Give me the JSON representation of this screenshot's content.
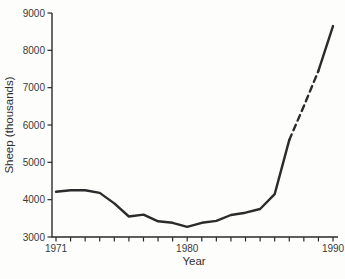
{
  "chart_data": {
    "type": "line",
    "title": "",
    "xlabel": "Year",
    "ylabel": "Sheep (thousands)",
    "x": [
      1971,
      1972,
      1973,
      1974,
      1975,
      1976,
      1977,
      1978,
      1979,
      1980,
      1981,
      1982,
      1983,
      1984,
      1985,
      1986,
      1987,
      1988,
      1989,
      1990
    ],
    "values": [
      4210,
      4250,
      4250,
      4180,
      3900,
      3550,
      3600,
      3420,
      3380,
      3270,
      3380,
      3430,
      3590,
      3650,
      3750,
      4150,
      5600,
      6500,
      7450,
      8650
    ],
    "dashed_segment": {
      "from_year": 1987,
      "to_year": 1989,
      "meaning": "dashed-projection"
    },
    "xlim": [
      1971,
      1990
    ],
    "ylim": [
      3000,
      9000
    ],
    "y_ticks": [
      3000,
      4000,
      5000,
      6000,
      7000,
      8000,
      9000
    ],
    "x_ticks_every_year": true,
    "labeled_x_ticks": [
      1971,
      1980,
      1990
    ],
    "grid": false,
    "legend_position": "none",
    "line_color": "#2b2b2b",
    "axis_color": "#2b2b2b",
    "text_color": "#3a3a3a",
    "background_color": "#fdfdfc"
  }
}
